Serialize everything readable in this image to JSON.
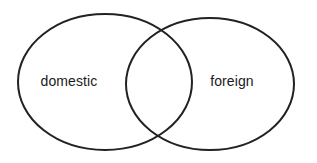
{
  "diagram": {
    "type": "venn",
    "title": "",
    "background_color": "#ffffff",
    "stroke_color": "#222222",
    "stroke_width": 2,
    "label_color": "#1a1a1a",
    "label_font_size": 14,
    "sets": [
      {
        "id": "left",
        "label": "domestic",
        "shape": "ellipse",
        "cx": 105,
        "cy": 82,
        "rx": 87,
        "ry": 68,
        "label_x": 69,
        "label_y": 82
      },
      {
        "id": "right",
        "label": "foreign",
        "shape": "ellipse",
        "cx": 210,
        "cy": 84,
        "rx": 84,
        "ry": 66,
        "label_x": 232,
        "label_y": 82
      }
    ],
    "intersection": {
      "label": "",
      "top_crossing_x": 158,
      "top_crossing_y": 36,
      "bottom_crossing_x": 158,
      "bottom_crossing_y": 128
    }
  }
}
